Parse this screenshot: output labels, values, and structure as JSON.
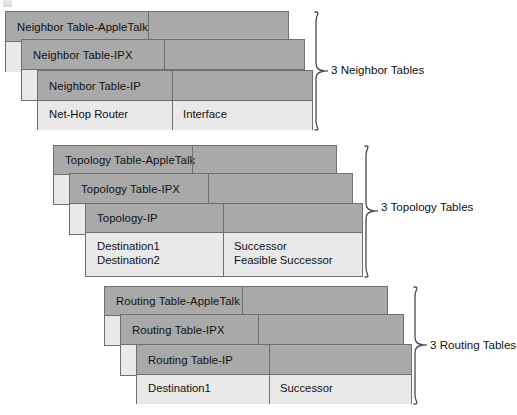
{
  "diagram": {
    "colors": {
      "header_gray": "#a9a9a9",
      "body_light": "#e9e9e9",
      "border": "#6f6f6f",
      "text": "#111111",
      "background": "#ffffff"
    },
    "groups": [
      {
        "id": "neighbor",
        "brace_label": "3 Neighbor Tables",
        "cards": [
          {
            "id": "neighbor-appletalk",
            "header": "Neighbor Table-AppleTalk",
            "role": "rear"
          },
          {
            "id": "neighbor-ipx",
            "header": "Neighbor Table-IPX",
            "role": "rear"
          },
          {
            "id": "neighbor-ip",
            "header": "Neighbor Table-IP",
            "role": "front",
            "columns": [
              {
                "rows": [
                  "Net-Hop Router"
                ]
              },
              {
                "rows": [
                  "Interface"
                ]
              }
            ]
          }
        ]
      },
      {
        "id": "topology",
        "brace_label": "3 Topology Tables",
        "cards": [
          {
            "id": "topology-appletalk",
            "header": "Topology Table-AppleTalk",
            "role": "rear"
          },
          {
            "id": "topology-ipx",
            "header": "Topology Table-IPX",
            "role": "rear"
          },
          {
            "id": "topology-ip",
            "header": "Topology-IP",
            "role": "front",
            "columns": [
              {
                "rows": [
                  "Destination1",
                  "Destination2"
                ]
              },
              {
                "rows": [
                  "Successor",
                  "Feasible Successor"
                ]
              }
            ]
          }
        ]
      },
      {
        "id": "routing",
        "brace_label": "3 Routing Tables",
        "cards": [
          {
            "id": "routing-appletalk",
            "header": "Routing Table-AppleTalk",
            "role": "rear"
          },
          {
            "id": "routing-ipx",
            "header": "Routing Table-IPX",
            "role": "rear"
          },
          {
            "id": "routing-ip",
            "header": "Routing Table-IP",
            "role": "front",
            "columns": [
              {
                "rows": [
                  "Destination1"
                ]
              },
              {
                "rows": [
                  "Successor"
                ]
              }
            ]
          }
        ]
      }
    ]
  }
}
